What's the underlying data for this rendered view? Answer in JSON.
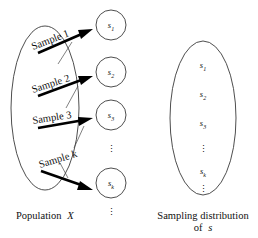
{
  "figure": {
    "background_color": "#ffffff",
    "ink_color": "#111111",
    "outline_color": "#3a3a3a"
  },
  "population": {
    "caption": "Population X",
    "caption_name": "Population",
    "caption_variable": "X"
  },
  "samples": [
    {
      "label": "Sample 1",
      "index": "1",
      "statistic": "s",
      "subscript": "1"
    },
    {
      "label": "Sample 2",
      "index": "2",
      "statistic": "s",
      "subscript": "2"
    },
    {
      "label": "Sample 3",
      "index": "3",
      "statistic": "s",
      "subscript": "3"
    },
    {
      "label": "Sample k",
      "index": "k",
      "statistic": "s",
      "subscript": "k"
    }
  ],
  "sample_circles": [
    {
      "statistic": "s",
      "subscript": "1"
    },
    {
      "statistic": "s",
      "subscript": "2"
    },
    {
      "statistic": "s",
      "subscript": "3"
    },
    {
      "statistic": "s",
      "subscript": "k"
    }
  ],
  "ellipsis": {
    "glyph": "⋮"
  },
  "distribution": {
    "caption_line1": "Sampling distribution",
    "caption_line2": "of s",
    "caption_of": "of",
    "caption_variable": "s",
    "entries": [
      {
        "statistic": "s",
        "subscript": "1"
      },
      {
        "statistic": "s",
        "subscript": "2"
      },
      {
        "statistic": "s",
        "subscript": "3"
      },
      {
        "statistic": "s",
        "subscript": "k"
      }
    ]
  }
}
